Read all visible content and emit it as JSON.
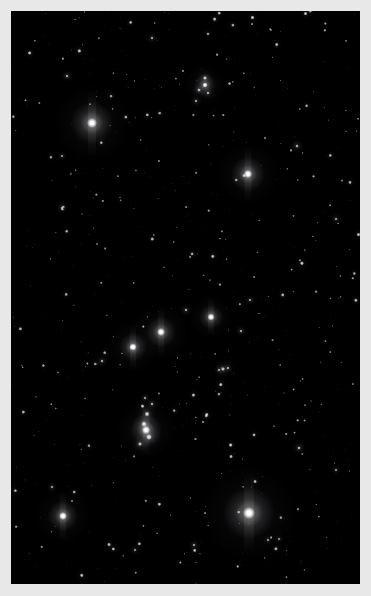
{
  "image": {
    "title": "Orion constellation night sky photograph",
    "subject": "Orion",
    "type": "astrophotograph",
    "width": 371,
    "height": 596,
    "background_color": "#000000",
    "frame_color": "#e8e8e8",
    "star_color": "#ffffff",
    "plate": {
      "x": 11,
      "y": 11,
      "width": 349,
      "height": 573
    }
  },
  "chart_data": {
    "type": "scatter",
    "xlabel": "",
    "ylabel": "",
    "xlim": [
      11,
      360
    ],
    "ylim": [
      11,
      584
    ],
    "grid": false,
    "legend": "none",
    "named_stars": [
      {
        "name": "Betelgeuse",
        "x": 92,
        "y": 123,
        "r": 5.0,
        "mag": 1.0,
        "halo": 21
      },
      {
        "name": "Bellatrix",
        "x": 248,
        "y": 174,
        "r": 4.2,
        "mag": 0.96,
        "halo": 17
      },
      {
        "name": "Alnitak",
        "x": 211,
        "y": 317,
        "r": 3.6,
        "mag": 0.94,
        "halo": 12
      },
      {
        "name": "Alnilam",
        "x": 161,
        "y": 332,
        "r": 4.0,
        "mag": 0.97,
        "halo": 15
      },
      {
        "name": "Mintaka",
        "x": 133,
        "y": 347,
        "r": 3.8,
        "mag": 0.95,
        "halo": 14
      },
      {
        "name": "Orion Nebula",
        "x": 146,
        "y": 430,
        "r": 4.2,
        "mag": 0.98,
        "halo": 16
      },
      {
        "name": "Rigel",
        "x": 249,
        "y": 513,
        "r": 6.0,
        "mag": 1.0,
        "halo": 26
      },
      {
        "name": "Saiph",
        "x": 63,
        "y": 516,
        "r": 4.0,
        "mag": 0.95,
        "halo": 15
      },
      {
        "name": "Meissa",
        "x": 205,
        "y": 85,
        "r": 2.6,
        "mag": 0.85,
        "halo": 11
      }
    ],
    "bright_stars": [
      {
        "x": 205,
        "y": 78,
        "r": 2.0,
        "mag": 0.88
      },
      {
        "x": 199,
        "y": 90,
        "r": 1.8,
        "mag": 0.82
      },
      {
        "x": 208,
        "y": 93,
        "r": 1.6,
        "mag": 0.78
      },
      {
        "x": 196,
        "y": 101,
        "r": 1.5,
        "mag": 0.74
      },
      {
        "x": 147,
        "y": 414,
        "r": 2.4,
        "mag": 0.92
      },
      {
        "x": 144,
        "y": 424,
        "r": 2.8,
        "mag": 0.95
      },
      {
        "x": 149,
        "y": 437,
        "r": 2.9,
        "mag": 0.96
      },
      {
        "x": 140,
        "y": 444,
        "r": 2.0,
        "mag": 0.86
      },
      {
        "x": 152,
        "y": 404,
        "r": 1.6,
        "mag": 0.78
      },
      {
        "x": 145,
        "y": 398,
        "r": 1.4,
        "mag": 0.72
      },
      {
        "x": 297,
        "y": 146,
        "r": 1.7,
        "mag": 0.8
      },
      {
        "x": 223,
        "y": 369,
        "r": 2.0,
        "mag": 0.86
      },
      {
        "x": 228,
        "y": 368,
        "r": 1.5,
        "mag": 0.76
      },
      {
        "x": 219,
        "y": 370,
        "r": 1.4,
        "mag": 0.72
      },
      {
        "x": 102,
        "y": 361,
        "r": 1.6,
        "mag": 0.78
      },
      {
        "x": 186,
        "y": 310,
        "r": 1.6,
        "mag": 0.78
      },
      {
        "x": 250,
        "y": 300,
        "r": 1.4,
        "mag": 0.72
      },
      {
        "x": 67,
        "y": 76,
        "r": 1.6,
        "mag": 0.78
      },
      {
        "x": 152,
        "y": 38,
        "r": 1.5,
        "mag": 0.76
      },
      {
        "x": 62,
        "y": 208,
        "r": 1.4,
        "mag": 0.72
      },
      {
        "x": 299,
        "y": 448,
        "r": 1.7,
        "mag": 0.8
      },
      {
        "x": 336,
        "y": 219,
        "r": 1.4,
        "mag": 0.72
      },
      {
        "x": 62,
        "y": 156,
        "r": 1.3,
        "mag": 0.7
      },
      {
        "x": 241,
        "y": 331,
        "r": 1.5,
        "mag": 0.76
      },
      {
        "x": 194,
        "y": 545,
        "r": 1.4,
        "mag": 0.72
      },
      {
        "x": 135,
        "y": 550,
        "r": 1.3,
        "mag": 0.68
      },
      {
        "x": 268,
        "y": 540,
        "r": 1.3,
        "mag": 0.68
      },
      {
        "x": 279,
        "y": 539,
        "r": 1.2,
        "mag": 0.66
      },
      {
        "x": 336,
        "y": 470,
        "r": 1.3,
        "mag": 0.68
      },
      {
        "x": 52,
        "y": 487,
        "r": 1.4,
        "mag": 0.72
      }
    ],
    "field_star_count": 900,
    "field_seed": 20240117
  }
}
